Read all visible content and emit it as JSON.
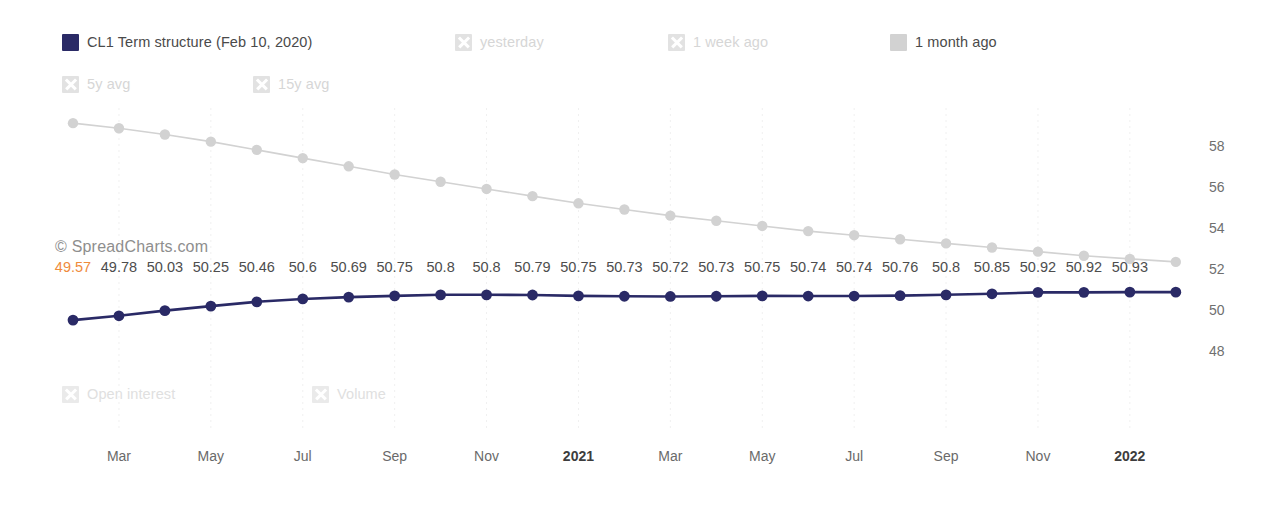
{
  "watermark": "© SpreadCharts.com",
  "legend": {
    "row1": [
      {
        "label": "CL1 Term structure (Feb 10, 2020)",
        "marker": "swatch",
        "color": "#2a2a66",
        "state": "active",
        "name": "legend-cl1-term-structure"
      },
      {
        "label": "yesterday",
        "marker": "x-box",
        "color": "#e2e2e2",
        "state": "inactive",
        "name": "legend-yesterday"
      },
      {
        "label": "1 week ago",
        "marker": "x-box",
        "color": "#e2e2e2",
        "state": "inactive",
        "name": "legend-1-week-ago"
      },
      {
        "label": "1 month ago",
        "marker": "swatch",
        "color": "#d2d2d2",
        "state": "active",
        "name": "legend-1-month-ago"
      }
    ],
    "row2": [
      {
        "label": "5y avg",
        "marker": "x-box",
        "color": "#e2e2e2",
        "state": "inactive",
        "name": "legend-5y-avg"
      },
      {
        "label": "15y avg",
        "marker": "x-box",
        "color": "#e2e2e2",
        "state": "inactive",
        "name": "legend-15y-avg"
      }
    ],
    "row3": [
      {
        "label": "Open interest",
        "marker": "x-box",
        "color": "#e7e7e7",
        "state": "inactive",
        "name": "legend-open-interest"
      },
      {
        "label": "Volume",
        "marker": "x-box",
        "color": "#e7e7e7",
        "state": "inactive",
        "name": "legend-volume"
      }
    ]
  },
  "chart_data": {
    "type": "line",
    "title": "CL1 Term structure (Feb 10, 2020)",
    "xlabel": "",
    "ylabel": "",
    "ylim": [
      46.9,
      59.4
    ],
    "yticks": [
      58,
      56,
      54,
      52,
      50,
      48
    ],
    "grid": true,
    "legend_position": "top",
    "x": [
      "Feb",
      "Mar",
      "Apr",
      "May",
      "Jun",
      "Jul",
      "Aug",
      "Sep",
      "Oct",
      "Nov",
      "Dec",
      "2021",
      "Feb",
      "Mar",
      "Apr",
      "May",
      "Jun",
      "Jul",
      "Aug",
      "Sep",
      "Oct",
      "Nov",
      "Dec",
      "2022",
      "Feb"
    ],
    "xticks": [
      {
        "label": "Mar",
        "index": 1,
        "bold": false
      },
      {
        "label": "May",
        "index": 3,
        "bold": false
      },
      {
        "label": "Jul",
        "index": 5,
        "bold": false
      },
      {
        "label": "Sep",
        "index": 7,
        "bold": false
      },
      {
        "label": "Nov",
        "index": 9,
        "bold": false
      },
      {
        "label": "2021",
        "index": 11,
        "bold": true
      },
      {
        "label": "Mar",
        "index": 13,
        "bold": false
      },
      {
        "label": "May",
        "index": 15,
        "bold": false
      },
      {
        "label": "Jul",
        "index": 17,
        "bold": false
      },
      {
        "label": "Sep",
        "index": 19,
        "bold": false
      },
      {
        "label": "Nov",
        "index": 21,
        "bold": false
      },
      {
        "label": "2022",
        "index": 23,
        "bold": true
      }
    ],
    "series": [
      {
        "name": "CL1 Term structure (Feb 10, 2020)",
        "color": "#2a2a66",
        "marker": "circle",
        "labels_shown": true,
        "values": [
          49.57,
          49.78,
          50.03,
          50.25,
          50.46,
          50.6,
          50.69,
          50.75,
          50.8,
          50.8,
          50.79,
          50.75,
          50.73,
          50.72,
          50.73,
          50.75,
          50.74,
          50.74,
          50.76,
          50.8,
          50.85,
          50.92,
          50.92,
          50.93,
          50.93
        ],
        "point_labels": [
          "49.57",
          "49.78",
          "50.03",
          "50.25",
          "50.46",
          "50.6",
          "50.69",
          "50.75",
          "50.8",
          "50.8",
          "50.79",
          "50.75",
          "50.73",
          "50.72",
          "50.73",
          "50.75",
          "50.74",
          "50.74",
          "50.76",
          "50.8",
          "50.85",
          "50.92",
          "50.92",
          "50.93"
        ],
        "first_label_color": "#ef8b3c"
      },
      {
        "name": "1 month ago",
        "color": "#d2d2d2",
        "marker": "circle",
        "labels_shown": false,
        "values": [
          59.15,
          58.9,
          58.6,
          58.25,
          57.85,
          57.45,
          57.05,
          56.65,
          56.3,
          55.95,
          55.6,
          55.25,
          54.95,
          54.65,
          54.4,
          54.15,
          53.9,
          53.7,
          53.5,
          53.3,
          53.1,
          52.9,
          52.7,
          52.55,
          52.4
        ]
      }
    ]
  }
}
